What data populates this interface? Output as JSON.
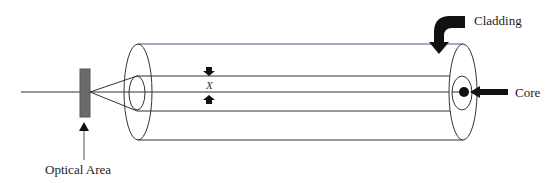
{
  "diagram": {
    "labels": {
      "cladding": "Cladding",
      "core": "Core",
      "optical_area": "Optical Area",
      "dimension": "X"
    },
    "colors": {
      "line": "#333333",
      "optical_element": "#6b6b6b",
      "arrow": "#111111",
      "top_edge": "#5a4a8a"
    }
  }
}
